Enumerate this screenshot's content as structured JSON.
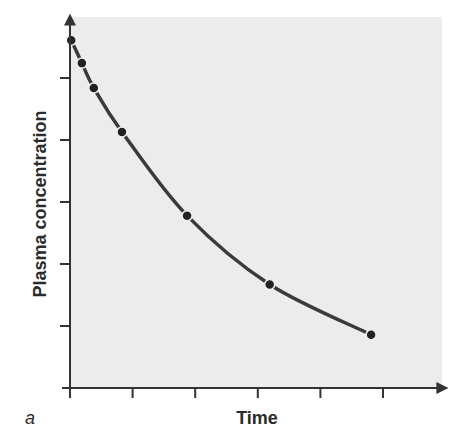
{
  "chart_data": {
    "type": "line",
    "title": "",
    "panel_label": "a",
    "xlabel": "Time",
    "ylabel": "Plasma concentration",
    "x_tick_count": 6,
    "y_tick_count": 5,
    "tick_labels_shown": false,
    "grid": false,
    "legend": null,
    "plot_background": "#ececec",
    "line_color": "#3a3a3a",
    "marker_color": "#222222",
    "xlim": [
      0,
      6
    ],
    "ylim": [
      0,
      6
    ],
    "series": [
      {
        "name": "Plasma concentration",
        "curve": "exponential decay",
        "points": [
          {
            "x": 0.02,
            "y": 5.61
          },
          {
            "x": 0.19,
            "y": 5.24
          },
          {
            "x": 0.38,
            "y": 4.84
          },
          {
            "x": 0.83,
            "y": 4.13
          },
          {
            "x": 1.87,
            "y": 2.78
          },
          {
            "x": 3.19,
            "y": 1.67
          },
          {
            "x": 4.81,
            "y": 0.86
          }
        ]
      }
    ]
  }
}
